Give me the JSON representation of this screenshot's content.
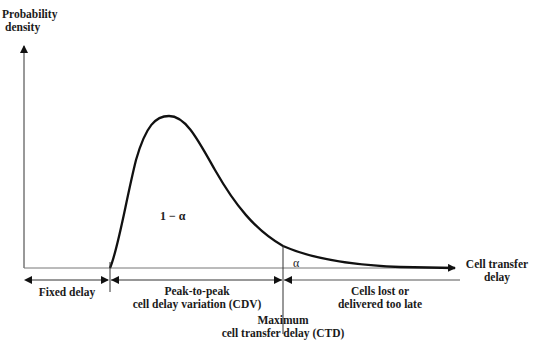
{
  "diagram": {
    "type": "probability-density-curve",
    "y_axis_label": [
      "Probability",
      "density"
    ],
    "x_axis_label": [
      "Cell transfer",
      "delay"
    ],
    "area_labels": {
      "main": "1 − α",
      "tail": "α"
    },
    "intervals": [
      {
        "label": [
          "Fixed delay"
        ]
      },
      {
        "label": [
          "Peak-to-peak",
          "cell delay variation (CDV)"
        ]
      },
      {
        "label": [
          "Cells lost or",
          "delivered too late"
        ]
      }
    ],
    "markers": {
      "ctd": [
        "Maximum",
        "cell transfer delay (CTD)"
      ]
    }
  }
}
